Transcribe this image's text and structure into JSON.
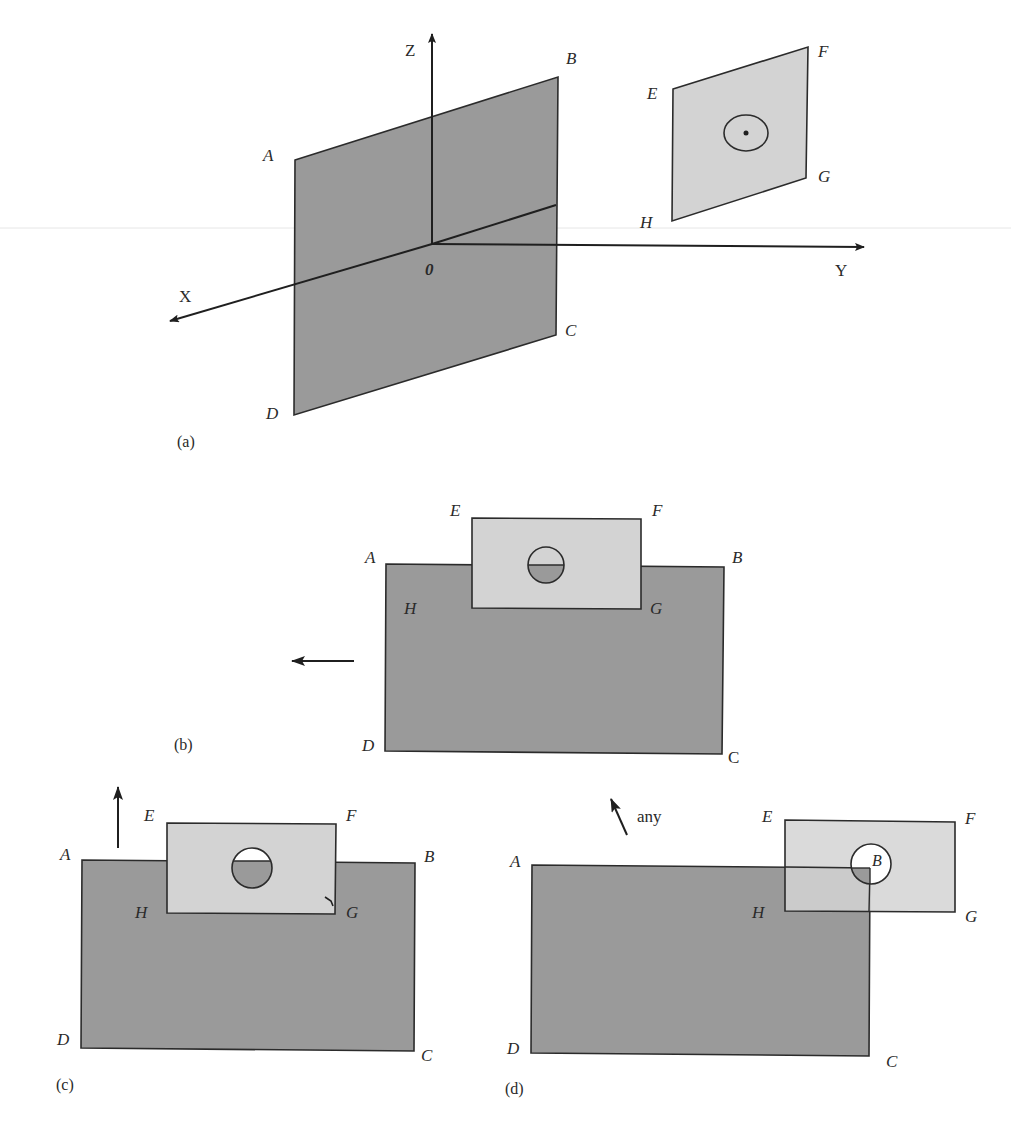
{
  "figure": {
    "colors": {
      "dark_plane": "#9a9a9a",
      "light_plane": "#d3d3d3",
      "stroke": "#2b2b2b",
      "background": "#ffffff"
    },
    "panel_a": {
      "caption": "(a)",
      "axes": {
        "x": "X",
        "y": "Y",
        "z": "Z",
        "origin": "0"
      },
      "plane_abcd": {
        "A": "A",
        "B": "B",
        "C": "C",
        "D": "D"
      },
      "plane_efgh": {
        "E": "E",
        "F": "F",
        "G": "G",
        "H": "H"
      }
    },
    "panel_b": {
      "caption": "(b)",
      "plane_abcd": {
        "A": "A",
        "B": "B",
        "C": "C",
        "D": "D"
      },
      "plane_efgh": {
        "E": "E",
        "F": "F",
        "G": "G",
        "H": "H"
      },
      "motion": "left"
    },
    "panel_c": {
      "caption": "(c)",
      "plane_abcd": {
        "A": "A",
        "B": "B",
        "C": "C",
        "D": "D"
      },
      "plane_efgh": {
        "E": "E",
        "F": "F",
        "G": "G",
        "H": "H"
      },
      "motion": "up"
    },
    "panel_d": {
      "caption": "(d)",
      "plane_abcd": {
        "A": "A",
        "B": "B",
        "C": "C",
        "D": "D"
      },
      "plane_efgh": {
        "E": "E",
        "F": "F",
        "G": "G",
        "H": "H"
      },
      "motion_label": "any"
    }
  }
}
